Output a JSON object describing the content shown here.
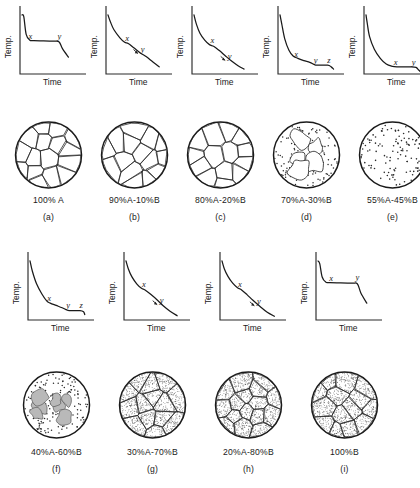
{
  "figure": {
    "axis_labels": {
      "y": "Temp.",
      "x": "Time"
    },
    "markers": {
      "x": "x",
      "y": "y",
      "z": "z"
    }
  },
  "panels": [
    {
      "id": "a",
      "letter": "(a)",
      "composition": "100% A",
      "curve_type": "plateau",
      "markers": [
        "x",
        "y"
      ],
      "micro": "open-grains",
      "grain_count": 16,
      "dot_count": 0
    },
    {
      "id": "b",
      "letter": "(b)",
      "composition": "90%A-10%B",
      "curve_type": "sloping-inflection",
      "markers": [
        "x",
        "y"
      ],
      "micro": "open-grains",
      "grain_count": 15,
      "dot_count": 0
    },
    {
      "id": "c",
      "letter": "(c)",
      "composition": "80%A-20%B",
      "curve_type": "sloping-inflection",
      "markers": [
        "x",
        "y"
      ],
      "micro": "open-grains",
      "grain_count": 14,
      "dot_count": 0
    },
    {
      "id": "d",
      "letter": "(d)",
      "composition": "70%A-30%B",
      "curve_type": "bend-plateau-drop",
      "markers": [
        "x",
        "y",
        "z"
      ],
      "micro": "white-blobs-dotted",
      "blob_count": 5,
      "dot_count": 95
    },
    {
      "id": "e",
      "letter": "(e)",
      "composition": "55%A-45%B",
      "curve_type": "eutectic-long-plateau",
      "markers": [
        "x",
        "y"
      ],
      "micro": "all-dots",
      "blob_count": 0,
      "dot_count": 80
    },
    {
      "id": "f",
      "letter": "(f)",
      "composition": "40%A-60%B",
      "curve_type": "bend-plateau-drop",
      "markers": [
        "x",
        "y",
        "z"
      ],
      "micro": "gray-blobs-dotted",
      "blob_count": 7,
      "dot_count": 95
    },
    {
      "id": "g",
      "letter": "(g)",
      "composition": "30%A-70%B",
      "curve_type": "sloping-inflection",
      "markers": [
        "x",
        "y"
      ],
      "micro": "stippled-grains",
      "grain_count": 14,
      "dot_count": 0
    },
    {
      "id": "h",
      "letter": "(h)",
      "composition": "20%A-80%B",
      "curve_type": "sloping-inflection",
      "markers": [
        "x",
        "y"
      ],
      "micro": "stippled-grains",
      "grain_count": 16,
      "dot_count": 0
    },
    {
      "id": "i",
      "letter": "(i)",
      "composition": "100%B",
      "curve_type": "plateau",
      "markers": [
        "x",
        "y"
      ],
      "micro": "stippled-grains",
      "grain_count": 14,
      "dot_count": 0
    }
  ],
  "chart_data": {
    "type": "line",
    "title": "",
    "xlabel": "Time",
    "ylabel": "Temp.",
    "series": [
      {
        "name": "a",
        "composition": "100% A",
        "points": [
          [
            0,
            100
          ],
          [
            3,
            97
          ],
          [
            7,
            66
          ],
          [
            13,
            56
          ],
          [
            20,
            55
          ],
          [
            52,
            54
          ],
          [
            62,
            53
          ],
          [
            68,
            41
          ],
          [
            78,
            26
          ]
        ],
        "annotations": [
          {
            "label": "x",
            "x": 14,
            "y": 58
          },
          {
            "label": "y",
            "x": 63,
            "y": 58
          }
        ]
      },
      {
        "name": "b",
        "composition": "90%A-10%B",
        "points": [
          [
            0,
            100
          ],
          [
            4,
            88
          ],
          [
            10,
            74
          ],
          [
            20,
            60
          ],
          [
            28,
            52
          ],
          [
            34,
            50
          ],
          [
            44,
            42
          ],
          [
            55,
            33
          ],
          [
            64,
            27
          ],
          [
            76,
            17
          ],
          [
            86,
            9
          ]
        ],
        "annotations": [
          {
            "label": "x",
            "x": 32,
            "y": 55
          },
          {
            "label": "y",
            "x": 58,
            "y": 35
          }
        ]
      },
      {
        "name": "c",
        "composition": "80%A-20%B",
        "points": [
          [
            0,
            100
          ],
          [
            4,
            84
          ],
          [
            10,
            68
          ],
          [
            18,
            56
          ],
          [
            26,
            48
          ],
          [
            33,
            45
          ],
          [
            42,
            38
          ],
          [
            52,
            29
          ],
          [
            62,
            20
          ],
          [
            74,
            11
          ],
          [
            84,
            5
          ]
        ],
        "annotations": [
          {
            "label": "x",
            "x": 31,
            "y": 50
          },
          {
            "label": "y",
            "x": 60,
            "y": 23
          }
        ]
      },
      {
        "name": "d",
        "composition": "70%A-30%B",
        "points": [
          [
            0,
            100
          ],
          [
            3,
            84
          ],
          [
            8,
            58
          ],
          [
            15,
            38
          ],
          [
            22,
            28
          ],
          [
            30,
            24
          ],
          [
            40,
            20
          ],
          [
            50,
            17
          ],
          [
            58,
            13
          ],
          [
            62,
            12
          ],
          [
            80,
            12
          ],
          [
            86,
            9
          ],
          [
            90,
            5
          ]
        ],
        "annotations": [
          {
            "label": "x",
            "x": 27,
            "y": 27
          },
          {
            "label": "y",
            "x": 60,
            "y": 16
          },
          {
            "label": "z",
            "x": 82,
            "y": 16
          }
        ]
      },
      {
        "name": "e",
        "composition": "55%A-45%B",
        "points": [
          [
            0,
            100
          ],
          [
            2,
            86
          ],
          [
            6,
            62
          ],
          [
            14,
            40
          ],
          [
            24,
            24
          ],
          [
            34,
            14
          ],
          [
            44,
            10
          ],
          [
            52,
            9
          ],
          [
            76,
            9
          ],
          [
            84,
            8
          ],
          [
            88,
            4
          ],
          [
            92,
            0
          ]
        ],
        "annotations": [
          {
            "label": "x",
            "x": 50,
            "y": 13
          },
          {
            "label": "y",
            "x": 80,
            "y": 13
          }
        ]
      },
      {
        "name": "f",
        "composition": "40%A-60%B",
        "points": [
          [
            0,
            100
          ],
          [
            4,
            82
          ],
          [
            11,
            60
          ],
          [
            20,
            42
          ],
          [
            28,
            30
          ],
          [
            34,
            26
          ],
          [
            44,
            22
          ],
          [
            54,
            18
          ],
          [
            62,
            14
          ],
          [
            66,
            13
          ],
          [
            84,
            13
          ],
          [
            90,
            11
          ],
          [
            92,
            6
          ]
        ],
        "annotations": [
          {
            "label": "x",
            "x": 32,
            "y": 30
          },
          {
            "label": "y",
            "x": 64,
            "y": 17
          },
          {
            "label": "z",
            "x": 86,
            "y": 17
          }
        ]
      },
      {
        "name": "g",
        "composition": "30%A-70%B",
        "points": [
          [
            0,
            100
          ],
          [
            4,
            86
          ],
          [
            10,
            72
          ],
          [
            18,
            60
          ],
          [
            26,
            52
          ],
          [
            32,
            49
          ],
          [
            42,
            41
          ],
          [
            52,
            32
          ],
          [
            62,
            22
          ],
          [
            74,
            12
          ],
          [
            86,
            4
          ]
        ],
        "annotations": [
          {
            "label": "x",
            "x": 30,
            "y": 54
          },
          {
            "label": "y",
            "x": 60,
            "y": 26
          }
        ]
      },
      {
        "name": "h",
        "composition": "20%A-80%B",
        "points": [
          [
            0,
            100
          ],
          [
            4,
            86
          ],
          [
            10,
            73
          ],
          [
            18,
            61
          ],
          [
            26,
            53
          ],
          [
            32,
            50
          ],
          [
            42,
            41
          ],
          [
            52,
            31
          ],
          [
            64,
            20
          ],
          [
            76,
            10
          ],
          [
            88,
            3
          ]
        ],
        "annotations": [
          {
            "label": "x",
            "x": 30,
            "y": 55
          },
          {
            "label": "y",
            "x": 62,
            "y": 24
          }
        ]
      },
      {
        "name": "i",
        "composition": "100%B",
        "points": [
          [
            0,
            100
          ],
          [
            3,
            95
          ],
          [
            7,
            72
          ],
          [
            13,
            63
          ],
          [
            20,
            62
          ],
          [
            56,
            61
          ],
          [
            66,
            60
          ],
          [
            72,
            44
          ],
          [
            82,
            26
          ]
        ],
        "annotations": [
          {
            "label": "x",
            "x": 22,
            "y": 65
          },
          {
            "label": "y",
            "x": 66,
            "y": 66
          }
        ]
      }
    ]
  }
}
